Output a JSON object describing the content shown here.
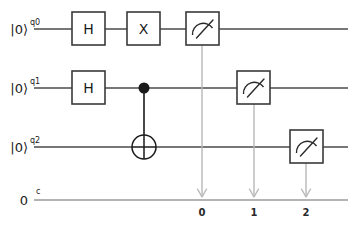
{
  "diagram": {
    "type": "quantum-circuit",
    "width": 361,
    "height": 228,
    "background_color": "#ffffff",
    "wire_color": "#4a4a4a",
    "classical_wire_color": "#9a9a9a",
    "gate_border_color": "#3a3a3a",
    "gate_fill_color": "#ffffff",
    "measure_line_color": "#b8b8b8"
  },
  "quantum_registers": [
    {
      "ket": "|0⟩",
      "name": "q0",
      "wire_y": 29
    },
    {
      "ket": "|0⟩",
      "name": "q1",
      "wire_y": 88
    },
    {
      "ket": "|0⟩",
      "name": "q2",
      "wire_y": 147
    }
  ],
  "classical_register": {
    "index_label": "0",
    "name": "c",
    "wire_y": 200
  },
  "gates": [
    {
      "id": "h-q0",
      "label": "H",
      "kind": "box",
      "wire": 0,
      "x": 72,
      "y": 12,
      "w": 33,
      "h": 33
    },
    {
      "id": "x-q0",
      "label": "X",
      "kind": "box",
      "wire": 0,
      "x": 127,
      "y": 12,
      "w": 33,
      "h": 33
    },
    {
      "id": "h-q1",
      "label": "H",
      "kind": "box",
      "wire": 1,
      "x": 72,
      "y": 71,
      "w": 33,
      "h": 33
    },
    {
      "id": "cnot",
      "label": "CNOT",
      "kind": "controlled-not",
      "control_wire": 1,
      "target_wire": 2,
      "cx": 144,
      "control_y": 88,
      "target_y": 147,
      "radius": 12
    }
  ],
  "measurements": [
    {
      "id": "measure-q0",
      "wire": 0,
      "x": 186,
      "y": 12,
      "w": 33,
      "h": 33,
      "drop_x": 202,
      "clbit_label": "0"
    },
    {
      "id": "measure-q1",
      "wire": 1,
      "x": 237,
      "y": 71,
      "w": 33,
      "h": 33,
      "drop_x": 254,
      "clbit_label": "1"
    },
    {
      "id": "measure-q2",
      "wire": 2,
      "x": 290,
      "y": 130,
      "w": 33,
      "h": 33,
      "drop_x": 306,
      "clbit_label": "2"
    }
  ],
  "wire_extent": {
    "x_start": 34,
    "x_end": 348
  }
}
